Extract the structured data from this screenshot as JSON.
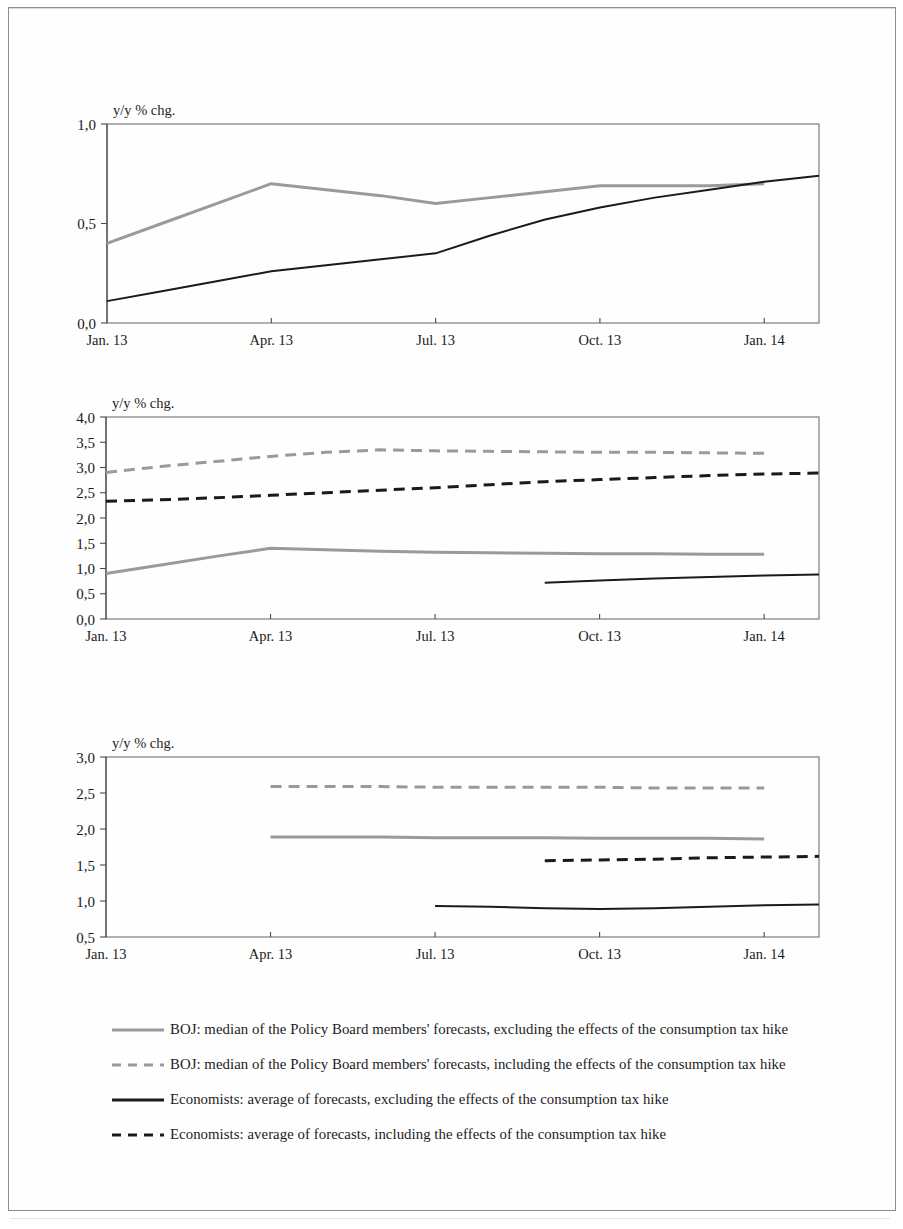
{
  "document": {
    "title": "BOJ and economists' forecasts",
    "axis_unit_label": "y/y % chg."
  },
  "colors": {
    "boj_excluding": "#9a9a9a",
    "boj_including": "#9a9a9a",
    "economists_excluding": "#1a1a1a",
    "economists_including": "#1a1a1a",
    "axis": "#4a4a4a",
    "plot_border": "#6f6f6f",
    "page_border": "#8e8e8e"
  },
  "legend": {
    "items": [
      {
        "id": "boj-excluding",
        "style": "solid",
        "color": "#9a9a9a",
        "label": "BOJ: median of the Policy Board members' forecasts, excluding the effects of the consumption tax hike"
      },
      {
        "id": "boj-including",
        "style": "dashed",
        "color": "#9a9a9a",
        "label": "BOJ: median of the Policy Board members' forecasts, including the effects of the consumption tax hike"
      },
      {
        "id": "economists-excluding",
        "style": "solid",
        "color": "#1a1a1a",
        "label": "Economists: average of forecasts, excluding the effects of the consumption tax hike"
      },
      {
        "id": "economists-including",
        "style": "dashed",
        "color": "#1a1a1a",
        "label": "Economists: average of forecasts, including the effects of the consumption tax hike"
      }
    ]
  },
  "chart_data": [
    {
      "id": "chart-1",
      "type": "line",
      "title": "",
      "ylabel": "y/y % chg.",
      "xlabel": "",
      "ylim": [
        0.0,
        1.0
      ],
      "yticks": [
        0.0,
        0.5,
        1.0
      ],
      "ytick_labels": [
        "0,0",
        "0,5",
        "1,0"
      ],
      "grid": false,
      "x": [
        0,
        1,
        2,
        3,
        4,
        5,
        6,
        7,
        8,
        9,
        10,
        11,
        12,
        13
      ],
      "xtick_positions": [
        0,
        3,
        6,
        9,
        12
      ],
      "xtick_labels": [
        "Jan. 13",
        "Apr. 13",
        "Jul. 13",
        "Oct. 13",
        "Jan. 14"
      ],
      "series": [
        {
          "name": "BOJ: median of the Policy Board members' forecasts, excluding the effects of the consumption tax hike",
          "style": "solid",
          "color": "#9a9a9a",
          "width": 3.0,
          "values": [
            0.4,
            0.5,
            0.6,
            0.7,
            0.67,
            0.64,
            0.6,
            0.63,
            0.66,
            0.69,
            0.69,
            0.69,
            0.7,
            null
          ]
        },
        {
          "name": "Economists: average of forecasts, excluding the effects of the consumption tax hike",
          "style": "solid",
          "color": "#1a1a1a",
          "width": 2.0,
          "values": [
            0.11,
            0.16,
            0.21,
            0.26,
            0.29,
            0.32,
            0.35,
            0.44,
            0.52,
            0.58,
            0.63,
            0.67,
            0.71,
            0.74
          ]
        }
      ]
    },
    {
      "id": "chart-2",
      "type": "line",
      "title": "",
      "ylabel": "y/y % chg.",
      "xlabel": "",
      "ylim": [
        0.0,
        4.0
      ],
      "yticks": [
        0.0,
        0.5,
        1.0,
        1.5,
        2.0,
        2.5,
        3.0,
        3.5,
        4.0
      ],
      "ytick_labels": [
        "0,0",
        "0,5",
        "1,0",
        "1,5",
        "2,0",
        "2,5",
        "3,0",
        "3,5",
        "4,0"
      ],
      "grid": false,
      "x": [
        0,
        1,
        2,
        3,
        4,
        5,
        6,
        7,
        8,
        9,
        10,
        11,
        12,
        13
      ],
      "xtick_positions": [
        0,
        3,
        6,
        9,
        12
      ],
      "xtick_labels": [
        "Jan. 13",
        "Apr. 13",
        "Jul. 13",
        "Oct. 13",
        "Jan. 14"
      ],
      "series": [
        {
          "name": "BOJ: median of the Policy Board members' forecasts, including the effects of the consumption tax hike",
          "style": "dashed",
          "color": "#9a9a9a",
          "width": 3.0,
          "values": [
            2.9,
            3.02,
            3.12,
            3.22,
            3.3,
            3.35,
            3.33,
            3.32,
            3.31,
            3.3,
            3.3,
            3.29,
            3.28,
            null
          ]
        },
        {
          "name": "Economists: average of forecasts, including the effects of the consumption tax hike",
          "style": "dashed",
          "color": "#1a1a1a",
          "width": 3.0,
          "values": [
            2.33,
            2.36,
            2.4,
            2.45,
            2.5,
            2.55,
            2.6,
            2.66,
            2.72,
            2.76,
            2.8,
            2.84,
            2.87,
            2.89
          ]
        },
        {
          "name": "BOJ: median of the Policy Board members' forecasts, excluding the effects of the consumption tax hike",
          "style": "solid",
          "color": "#9a9a9a",
          "width": 3.0,
          "values": [
            0.9,
            1.07,
            1.24,
            1.4,
            1.37,
            1.34,
            1.32,
            1.31,
            1.3,
            1.29,
            1.29,
            1.28,
            1.28,
            null
          ]
        },
        {
          "name": "Economists: average of forecasts, excluding the effects of the consumption tax hike",
          "style": "solid",
          "color": "#1a1a1a",
          "width": 2.0,
          "values": [
            null,
            null,
            null,
            null,
            null,
            null,
            null,
            null,
            0.72,
            0.76,
            0.8,
            0.83,
            0.86,
            0.88
          ]
        }
      ]
    },
    {
      "id": "chart-3",
      "type": "line",
      "title": "",
      "ylabel": "y/y % chg.",
      "xlabel": "",
      "ylim": [
        0.5,
        3.0
      ],
      "yticks": [
        0.5,
        1.0,
        1.5,
        2.0,
        2.5,
        3.0
      ],
      "ytick_labels": [
        "0,5",
        "1,0",
        "1,5",
        "2,0",
        "2,5",
        "3,0"
      ],
      "grid": false,
      "x": [
        0,
        1,
        2,
        3,
        4,
        5,
        6,
        7,
        8,
        9,
        10,
        11,
        12,
        13
      ],
      "xtick_positions": [
        0,
        3,
        6,
        9,
        12
      ],
      "xtick_labels": [
        "Jan. 13",
        "Apr. 13",
        "Jul. 13",
        "Oct. 13",
        "Jan. 14"
      ],
      "series": [
        {
          "name": "BOJ: median of the Policy Board members' forecasts, including the effects of the consumption tax hike",
          "style": "dashed",
          "color": "#9a9a9a",
          "width": 3.0,
          "values": [
            null,
            null,
            null,
            2.59,
            2.59,
            2.59,
            2.58,
            2.58,
            2.58,
            2.58,
            2.57,
            2.57,
            2.57,
            null
          ]
        },
        {
          "name": "BOJ: median of the Policy Board members' forecasts, excluding the effects of the consumption tax hike",
          "style": "solid",
          "color": "#9a9a9a",
          "width": 3.0,
          "values": [
            null,
            null,
            null,
            1.89,
            1.89,
            1.89,
            1.88,
            1.88,
            1.88,
            1.87,
            1.87,
            1.87,
            1.86,
            null
          ]
        },
        {
          "name": "Economists: average of forecasts, including the effects of the consumption tax hike",
          "style": "dashed",
          "color": "#1a1a1a",
          "width": 3.0,
          "values": [
            null,
            null,
            null,
            null,
            null,
            null,
            null,
            null,
            1.56,
            1.57,
            1.58,
            1.6,
            1.61,
            1.62
          ]
        },
        {
          "name": "Economists: average of forecasts, excluding the effects of the consumption tax hike",
          "style": "solid",
          "color": "#1a1a1a",
          "width": 2.0,
          "values": [
            null,
            null,
            null,
            null,
            null,
            null,
            0.93,
            0.92,
            0.9,
            0.89,
            0.9,
            0.92,
            0.94,
            0.95
          ]
        }
      ]
    }
  ],
  "layout": {
    "charts": [
      {
        "id": "chart-1",
        "left": 107,
        "top": 124,
        "width": 712,
        "height": 199,
        "label_top": 100,
        "label_left": 8
      },
      {
        "id": "chart-2",
        "left": 106,
        "top": 417,
        "width": 713,
        "height": 202,
        "label_top": 393,
        "label_left": 8
      },
      {
        "id": "chart-3",
        "left": 106,
        "top": 757,
        "width": 713,
        "height": 180,
        "label_top": 733,
        "label_left": 8
      }
    ]
  }
}
